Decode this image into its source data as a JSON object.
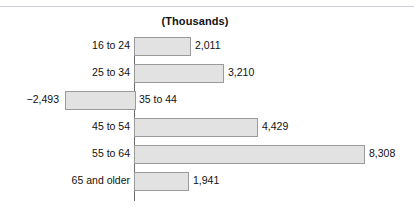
{
  "figure": {
    "width": 414,
    "height": 212,
    "background": "#ffffff",
    "ghost_top_text": "",
    "title": "(Thousands)"
  },
  "style": {
    "bar_fill": "#e2e2e2",
    "bar_border": "#9a9a9a",
    "axis_color": "#6d6d6d",
    "text_color": "#111111",
    "rule_color": "#c9ccd1"
  },
  "chart_data": {
    "type": "bar",
    "orientation": "horizontal",
    "title": "(Thousands)",
    "subtitle": "",
    "xlabel": "",
    "ylabel": "",
    "units": "thousands",
    "grid": false,
    "legend": false,
    "zero_line": true,
    "xlim": [
      -2493,
      8308
    ],
    "categories": [
      "16 to 24",
      "25 to 34",
      "35 to 44",
      "45 to 54",
      "55 to 64",
      "65 and older"
    ],
    "values": [
      2011,
      3210,
      -2493,
      4429,
      8308,
      1941
    ],
    "value_labels": [
      "2,011",
      "3,210",
      "−2,493",
      "4,429",
      "8,308",
      "1,941"
    ],
    "bars": [
      {
        "category": "16 to 24",
        "value": 2011,
        "value_label": "2,011",
        "sign": "positive",
        "label_side": "left",
        "value_side": "right"
      },
      {
        "category": "25 to 34",
        "value": 3210,
        "value_label": "3,210",
        "sign": "positive",
        "label_side": "left",
        "value_side": "right"
      },
      {
        "category": "35 to 44",
        "value": -2493,
        "value_label": "−2,493",
        "sign": "negative",
        "label_side": "right",
        "value_side": "left"
      },
      {
        "category": "45 to 54",
        "value": 4429,
        "value_label": "4,429",
        "sign": "positive",
        "label_side": "left",
        "value_side": "right"
      },
      {
        "category": "55 to 64",
        "value": 8308,
        "value_label": "8,308",
        "sign": "positive",
        "label_side": "left",
        "value_side": "right"
      },
      {
        "category": "65 and older",
        "value": 1941,
        "value_label": "1,941",
        "sign": "positive",
        "label_side": "left",
        "value_side": "right"
      }
    ]
  }
}
